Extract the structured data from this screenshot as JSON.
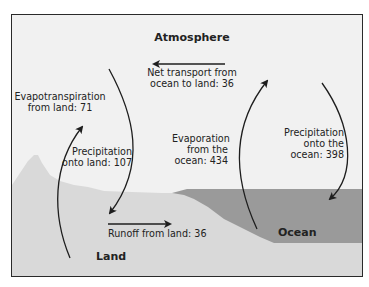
{
  "diagram": {
    "regions": {
      "atmosphere": "Atmosphere",
      "land": "Land",
      "ocean": "Ocean"
    },
    "flows": {
      "net_transport": {
        "line1": "Net transport from",
        "line2": "ocean to land: 36",
        "value": 36
      },
      "evapotranspiration": {
        "line1": "Evapotranspiration",
        "line2": "from land: 71",
        "value": 71
      },
      "precip_land": {
        "line1": "Precipitation",
        "line2": "onto land: 107",
        "value": 107
      },
      "evaporation_ocean": {
        "line1": "Evaporation",
        "line2": "from the",
        "line3": "ocean: 434",
        "value": 434
      },
      "precip_ocean": {
        "line1": "Precipitation",
        "line2": "onto the",
        "line3": "ocean: 398",
        "value": 398
      },
      "runoff": {
        "line1": "Runoff from land: 36",
        "value": 36
      }
    },
    "colors": {
      "background": "#f1f1f1",
      "land": "#d9d9d9",
      "ocean": "#9a9a9a",
      "ocean_floor": "#d9d9d9",
      "arrow": "#1e1e1e",
      "border": "#2a2a2a"
    }
  }
}
